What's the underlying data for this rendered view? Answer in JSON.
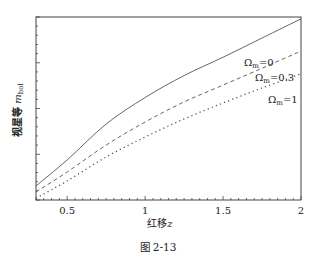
{
  "chart_data": {
    "type": "line",
    "title": "",
    "xlabel": "红移",
    "xlabel_var": "z",
    "ylabel": "视星等",
    "ylabel_var": "m",
    "ylabel_sub": "bol",
    "xlim": [
      0.3,
      2.0
    ],
    "ylim": [
      0,
      100
    ],
    "x_ticks": [
      0.5,
      1,
      1.5,
      2
    ],
    "x_tick_labels": [
      "0.5",
      "1",
      "1.5",
      "2"
    ],
    "y_tick_labels": [],
    "grid": false,
    "x": [
      0.3,
      0.5,
      0.75,
      1.0,
      1.25,
      1.5,
      1.75,
      2.0
    ],
    "series": [
      {
        "name": "Ωm=0",
        "symbol": "Ω",
        "sub": "m",
        "value_text": "=0",
        "style": "solid",
        "color": "#555555",
        "values": [
          7.7,
          21.9,
          41.5,
          56.0,
          68.0,
          78.0,
          88.5,
          99.0
        ]
      },
      {
        "name": "Ωm=0.3",
        "symbol": "Ω",
        "sub": "m",
        "value_text": "=0.3",
        "style": "dashed",
        "color": "#555555",
        "values": [
          4.4,
          15.3,
          30.0,
          42.6,
          53.6,
          62.8,
          72.0,
          81.4
        ]
      },
      {
        "name": "Ωm=1",
        "symbol": "Ω",
        "sub": "m",
        "value_text": "=1",
        "style": "dotted",
        "color": "#555555",
        "values": [
          1.0,
          10.4,
          23.5,
          34.4,
          44.3,
          53.0,
          61.2,
          68.9
        ]
      }
    ],
    "legend": "inline labels near right end of curves",
    "caption": "图 2-13"
  }
}
